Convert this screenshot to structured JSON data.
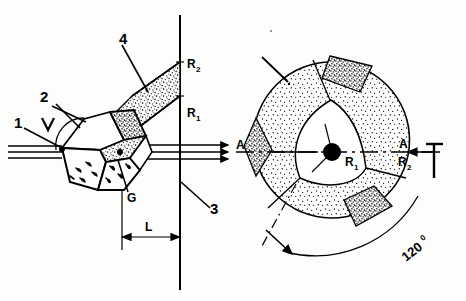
{
  "figure": {
    "name": "optical-prism-and-ring-aperture-diagram",
    "background_color": "#fdfdfb",
    "ink_color": "#000000",
    "stipple_color": "#1a1a1a"
  },
  "left_view": {
    "name": "perspective-prism-view",
    "labels": {
      "item1": "1",
      "item2": "2",
      "item3": "3",
      "item4": "4",
      "gap": "G",
      "length": "L",
      "radius_inner": "R",
      "radius_inner_sub": "1",
      "radius_outer": "R",
      "radius_outer_sub": "2"
    }
  },
  "right_view": {
    "name": "end-on-ring-aperture-view",
    "labels": {
      "section_left": "A",
      "section_right": "A",
      "radius_inner": "R",
      "radius_inner_sub": "1",
      "radius_outer": "R",
      "radius_outer_sub": "2",
      "angle": "120",
      "angle_unit": "0"
    }
  }
}
